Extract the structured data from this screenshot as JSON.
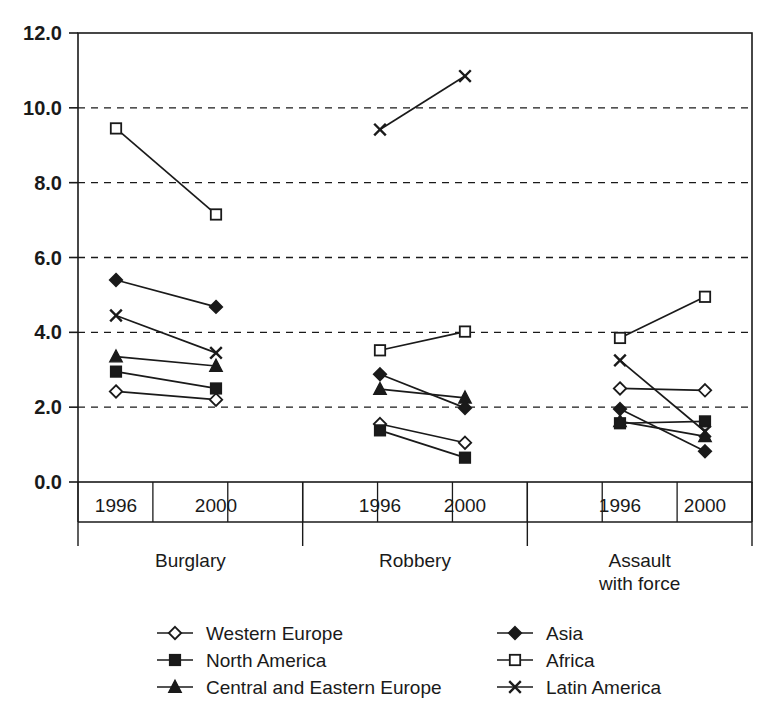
{
  "chart_data": {
    "type": "line",
    "title": "",
    "subtitle": "",
    "xlabel": "",
    "ylabel": "",
    "ylim": [
      0.0,
      12.0
    ],
    "ytick_step": 2.0,
    "yticks": [
      "0.0",
      "2.0",
      "4.0",
      "6.0",
      "8.0",
      "10.0",
      "12.0"
    ],
    "grid": "horizontal-dashed",
    "legend_position": "bottom",
    "group_labels": [
      "Burglary",
      "Robbery",
      "Assault with force"
    ],
    "group_label_lines": [
      [
        "Burglary"
      ],
      [
        "Robbery"
      ],
      [
        "Assault",
        "with force"
      ]
    ],
    "x_tick_labels": [
      "1996",
      "2000",
      "1996",
      "2000",
      "1996",
      "2000"
    ],
    "categories": [
      "Burglary 1996",
      "Burglary 2000",
      "Robbery 1996",
      "Robbery 2000",
      "Assault with force 1996",
      "Assault with force 2000"
    ],
    "series": [
      {
        "name": "Western Europe",
        "marker": "open-diamond",
        "values": [
          2.42,
          2.2,
          1.55,
          1.05,
          2.5,
          2.45
        ]
      },
      {
        "name": "North America",
        "marker": "filled-square",
        "values": [
          2.95,
          2.5,
          1.38,
          0.65,
          1.57,
          1.62
        ]
      },
      {
        "name": "Central and Eastern Europe",
        "marker": "filled-triangle",
        "values": [
          3.35,
          3.1,
          2.48,
          2.25,
          1.62,
          1.22
        ]
      },
      {
        "name": "Asia",
        "marker": "filled-diamond",
        "values": [
          5.4,
          4.68,
          2.88,
          1.98,
          1.95,
          0.82
        ]
      },
      {
        "name": "Africa",
        "marker": "open-square",
        "values": [
          9.45,
          7.15,
          3.52,
          4.02,
          3.85,
          4.95
        ]
      },
      {
        "name": "Latin America",
        "marker": "cross-x",
        "values": [
          4.45,
          3.45,
          9.42,
          10.85,
          3.25,
          1.35
        ]
      }
    ]
  },
  "legend": {
    "column_left": [
      "Western Europe",
      "North America",
      "Central and Eastern Europe"
    ],
    "column_right": [
      "Asia",
      "Africa",
      "Latin America"
    ]
  },
  "colors": {
    "axis": "#1a1a1a",
    "grid": "#1a1a1a",
    "series": "#1a1a1a",
    "background": "#ffffff"
  },
  "caption": {
    "partial_text": ""
  }
}
